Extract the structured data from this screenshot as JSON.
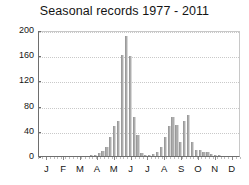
{
  "chart": {
    "title": "Seasonal records 1977 - 2011",
    "y_axis": {
      "ticks": [
        0,
        40,
        80,
        120,
        160,
        200
      ],
      "min": 0,
      "max": 200
    },
    "x_axis": {
      "month_labels": [
        "J",
        "F",
        "M",
        "A",
        "M",
        "J",
        "J",
        "A",
        "S",
        "O",
        "N",
        "D"
      ]
    }
  },
  "chart_data": {
    "type": "bar",
    "title": "Seasonal records 1977 - 2011",
    "xlabel": "",
    "ylabel": "",
    "ylim": [
      0,
      200
    ],
    "yticks": [
      0,
      40,
      80,
      120,
      160,
      200
    ],
    "grid": true,
    "legend": "none",
    "x_tick_labels": [
      "J",
      "F",
      "M",
      "A",
      "M",
      "J",
      "J",
      "A",
      "S",
      "O",
      "N",
      "D"
    ],
    "x_note": "52 weekly bins spanning January through December",
    "categories": [
      "W1",
      "W2",
      "W3",
      "W4",
      "W5",
      "W6",
      "W7",
      "W8",
      "W9",
      "W10",
      "W11",
      "W12",
      "W13",
      "W14",
      "W15",
      "W16",
      "W17",
      "W18",
      "W19",
      "W20",
      "W21",
      "W22",
      "W23",
      "W24",
      "W25",
      "W26",
      "W27",
      "W28",
      "W29",
      "W30",
      "W31",
      "W32",
      "W33",
      "W34",
      "W35",
      "W36",
      "W37",
      "W38",
      "W39",
      "W40",
      "W41",
      "W42",
      "W43",
      "W44",
      "W45",
      "W46",
      "W47",
      "W48",
      "W49",
      "W50",
      "W51",
      "W52"
    ],
    "values": [
      0,
      0,
      0,
      0,
      0,
      0,
      0,
      0,
      0,
      0,
      0,
      0,
      0,
      1,
      2,
      4,
      8,
      14,
      30,
      48,
      55,
      160,
      190,
      158,
      62,
      34,
      5,
      2,
      2,
      3,
      6,
      14,
      30,
      48,
      62,
      50,
      22,
      55,
      65,
      22,
      10,
      9,
      7,
      7,
      3,
      2,
      1,
      0,
      0,
      0,
      0,
      0
    ]
  }
}
